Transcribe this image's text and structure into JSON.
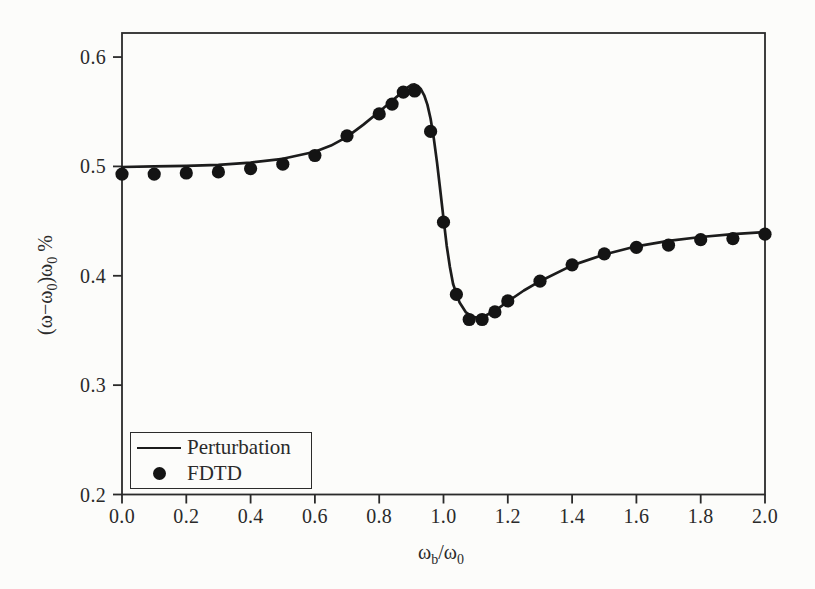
{
  "colors": {
    "ink": "#1c1c1c",
    "dot": "#141414",
    "axis": "#2a2a2a",
    "background": "#fcfcfa"
  },
  "chart_data": {
    "type": "line",
    "title": "",
    "xlabel": "ωb/ω0",
    "ylabel": "(ω−ω0)ω0 %",
    "xlabel_parts": {
      "p1": "ω",
      "s1": "b",
      "p2": "/ω",
      "s2": "0"
    },
    "ylabel_parts": {
      "p1": "(ω−ω",
      "s1": "0",
      "p2": ")ω",
      "s2": "0",
      "p3": " %"
    },
    "xlim": [
      0.0,
      2.0
    ],
    "ylim": [
      0.2,
      0.622
    ],
    "grid": false,
    "legend_position": "lower-left",
    "xticks": [
      0.0,
      0.2,
      0.4,
      0.6,
      0.8,
      1.0,
      1.2,
      1.4,
      1.6,
      1.8,
      2.0
    ],
    "xtick_labels": [
      "0.0",
      "0.2",
      "0.4",
      "0.6",
      "0.8",
      "1.0",
      "1.2",
      "1.4",
      "1.6",
      "1.8",
      "2.0"
    ],
    "yticks": [
      0.2,
      0.3,
      0.4,
      0.5,
      0.6
    ],
    "ytick_labels": [
      "0.2",
      "0.3",
      "0.4",
      "0.5",
      "0.6"
    ],
    "series": [
      {
        "name": "Perturbation",
        "style": "line",
        "color": "#1c1c1c",
        "x": [
          0.0,
          0.1,
          0.2,
          0.3,
          0.4,
          0.5,
          0.6,
          0.65,
          0.7,
          0.75,
          0.8,
          0.84,
          0.87,
          0.89,
          0.9,
          0.91,
          0.92,
          0.93,
          0.94,
          0.95,
          0.96,
          0.97,
          0.98,
          0.99,
          1.0,
          1.01,
          1.02,
          1.03,
          1.05,
          1.07,
          1.09,
          1.11,
          1.13,
          1.16,
          1.2,
          1.25,
          1.3,
          1.4,
          1.5,
          1.6,
          1.7,
          1.8,
          1.9,
          2.0
        ],
        "y": [
          0.4995,
          0.5,
          0.5005,
          0.5015,
          0.5035,
          0.507,
          0.5135,
          0.519,
          0.527,
          0.538,
          0.55,
          0.56,
          0.5675,
          0.5725,
          0.5745,
          0.575,
          0.5735,
          0.5705,
          0.565,
          0.5565,
          0.5435,
          0.525,
          0.503,
          0.478,
          0.4525,
          0.4275,
          0.408,
          0.3925,
          0.3755,
          0.3665,
          0.3625,
          0.3615,
          0.3635,
          0.368,
          0.3765,
          0.3865,
          0.395,
          0.4095,
          0.4195,
          0.427,
          0.432,
          0.4355,
          0.438,
          0.44
        ]
      },
      {
        "name": "FDTD",
        "style": "scatter",
        "color": "#141414",
        "x": [
          0.0,
          0.1,
          0.2,
          0.3,
          0.4,
          0.5,
          0.6,
          0.7,
          0.8,
          0.84,
          0.875,
          0.91,
          0.96,
          1.0,
          1.04,
          1.08,
          1.12,
          1.16,
          1.2,
          1.3,
          1.4,
          1.5,
          1.6,
          1.7,
          1.8,
          1.9,
          2.0
        ],
        "y": [
          0.493,
          0.493,
          0.494,
          0.495,
          0.498,
          0.502,
          0.51,
          0.528,
          0.548,
          0.557,
          0.568,
          0.569,
          0.532,
          0.449,
          0.383,
          0.36,
          0.36,
          0.367,
          0.377,
          0.395,
          0.41,
          0.42,
          0.426,
          0.428,
          0.433,
          0.434,
          0.438
        ]
      }
    ]
  }
}
